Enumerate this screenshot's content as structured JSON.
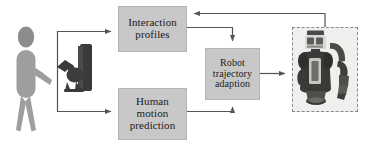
{
  "diagram": {
    "type": "flow-diagram",
    "background_color": "#ffffff",
    "box_fill_color": "#c8c8c8",
    "box_border_color": "#b4b4b4",
    "line_color": "#555555",
    "selection_frame_color": "#8a8a8a",
    "nodes": [
      {
        "id": "interaction_profiles",
        "label": "Interaction profiles",
        "lines": [
          "Interaction",
          "profiles"
        ]
      },
      {
        "id": "human_motion_prediction",
        "label": "Human motion prediction",
        "lines": [
          "Human",
          "motion",
          "prediction"
        ]
      },
      {
        "id": "robot_trajectory_adaption",
        "label": "Robot trajectory adaption",
        "lines": [
          "Robot",
          "trajectory",
          "adaption"
        ]
      }
    ],
    "images": [
      {
        "id": "human_operator",
        "label": "human-operator-figure"
      },
      {
        "id": "teaching_device",
        "label": "handheld-robot-manipulator"
      },
      {
        "id": "robot_platform",
        "label": "mobile-dual-arm-robot-photo"
      }
    ],
    "edges": [
      {
        "id": "human_to_interaction_profiles",
        "from": "human_operator",
        "to": "interaction_profiles",
        "arrow": true
      },
      {
        "id": "human_to_human_motion_prediction",
        "from": "human_operator",
        "to": "human_motion_prediction",
        "arrow": true
      },
      {
        "id": "interaction_profiles_to_robot_trajectory_adaption",
        "from": "interaction_profiles",
        "to": "robot_trajectory_adaption",
        "arrow": true
      },
      {
        "id": "human_motion_prediction_to_robot_trajectory_adaption",
        "from": "human_motion_prediction",
        "to": "robot_trajectory_adaption",
        "arrow": true
      },
      {
        "id": "robot_trajectory_adaption_to_robot",
        "from": "robot_trajectory_adaption",
        "to": "robot_platform",
        "arrow": true
      },
      {
        "id": "robot_feedback_to_interaction_profiles",
        "from": "robot_platform",
        "to": "interaction_profiles",
        "arrow": true
      }
    ]
  }
}
